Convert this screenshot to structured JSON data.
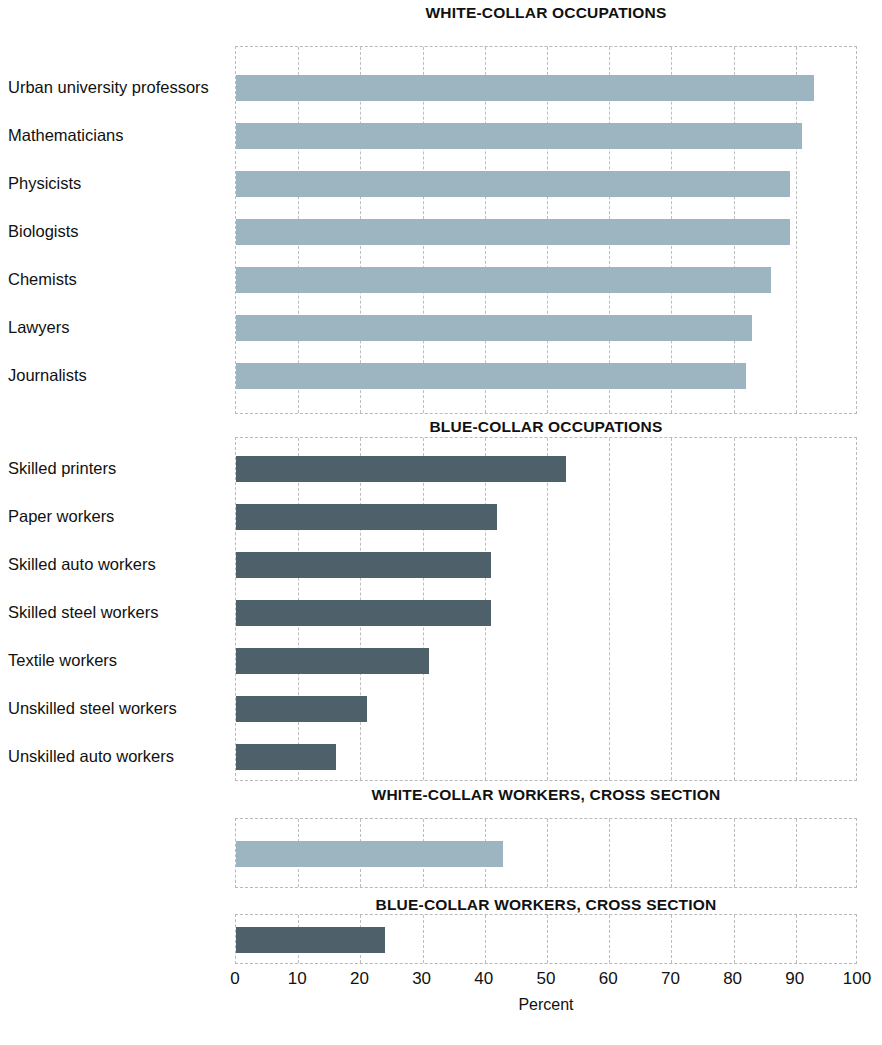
{
  "chart_data": {
    "type": "bar",
    "orientation": "horizontal",
    "xlabel": "Percent",
    "ylabel": "",
    "xlim": [
      0,
      100
    ],
    "xticks": [
      0,
      10,
      20,
      30,
      40,
      50,
      60,
      70,
      80,
      90,
      100
    ],
    "grid": true,
    "legend": "none",
    "colors": {
      "white_collar": "#9db5c0",
      "blue_collar": "#4e606a",
      "grid": "#bdbdbd",
      "frame": "#b9b9b9",
      "text": "#111111"
    },
    "panels": [
      {
        "title": "WHITE-COLLAR OCCUPATIONS",
        "series_color": "#9db5c0",
        "categories": [
          "Urban university professors",
          "Mathematicians",
          "Physicists",
          "Biologists",
          "Chemists",
          "Lawyers",
          "Journalists"
        ],
        "values": [
          93,
          91,
          89,
          89,
          86,
          83,
          82
        ]
      },
      {
        "title": "BLUE-COLLAR OCCUPATIONS",
        "series_color": "#4e606a",
        "categories": [
          "Skilled printers",
          "Paper workers",
          "Skilled auto workers",
          "Skilled steel workers",
          "Textile workers",
          "Unskilled steel workers",
          "Unskilled auto workers"
        ],
        "values": [
          53,
          42,
          41,
          41,
          31,
          21,
          16
        ]
      },
      {
        "title": "WHITE-COLLAR WORKERS, CROSS SECTION",
        "series_color": "#9db5c0",
        "categories": [
          ""
        ],
        "values": [
          43
        ]
      },
      {
        "title": "BLUE-COLLAR WORKERS, CROSS SECTION",
        "series_color": "#4e606a",
        "categories": [
          ""
        ],
        "values": [
          24
        ]
      }
    ]
  },
  "panel_titles": {
    "white_collar": "WHITE-COLLAR OCCUPATIONS",
    "blue_collar": "BLUE-COLLAR OCCUPATIONS",
    "white_cross": "WHITE-COLLAR WORKERS, CROSS SECTION",
    "blue_cross": "BLUE-COLLAR WORKERS, CROSS SECTION"
  },
  "labels": {
    "wc": [
      "Urban university professors",
      "Mathematicians",
      "Physicists",
      "Biologists",
      "Chemists",
      "Lawyers",
      "Journalists"
    ],
    "bc": [
      "Skilled printers",
      "Paper workers",
      "Skilled auto workers",
      "Skilled steel workers",
      "Textile workers",
      "Unskilled steel workers",
      "Unskilled auto workers"
    ]
  },
  "axis": {
    "title": "Percent",
    "ticks": [
      "0",
      "10",
      "20",
      "30",
      "40",
      "50",
      "60",
      "70",
      "80",
      "90",
      "100"
    ]
  }
}
